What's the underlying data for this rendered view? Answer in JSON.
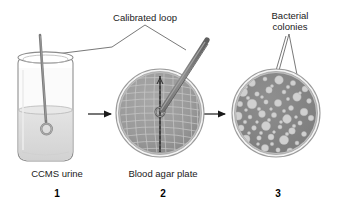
{
  "figure": {
    "type": "diagram",
    "background_color": "#ffffff",
    "ink_color": "#1a1a1a"
  },
  "annotations": {
    "calibrated_loop": {
      "label": "Calibrated loop",
      "x": 103,
      "y": 12,
      "width": 84
    },
    "bacterial_colonies": {
      "label_line1": "Bacterial",
      "label_line2": "colonies",
      "x": 261,
      "y": 10,
      "width": 58
    }
  },
  "steps": [
    {
      "number": "1",
      "caption": "CCMS urine",
      "caption_x": 12,
      "caption_y": 168,
      "caption_width": 90,
      "number_x": 37,
      "number_y": 188,
      "object": "specimen-jar"
    },
    {
      "number": "2",
      "caption": "Blood agar plate",
      "caption_x": 110,
      "caption_y": 168,
      "caption_width": 106,
      "number_x": 143,
      "number_y": 188,
      "object": "streaked-agar-plate"
    },
    {
      "number": "3",
      "caption": "",
      "caption_x": 240,
      "caption_y": 168,
      "caption_width": 60,
      "number_x": 258,
      "number_y": 188,
      "object": "colony-plate"
    }
  ],
  "colors": {
    "jar_glass_stroke": "#8c8c8c",
    "jar_liquid": "#dcdcdc",
    "wire": "#7a7a7a",
    "agar_fill": "#9a9a9a",
    "agar_rim": "#b5b5b5",
    "streak_line": "#c9c9c9",
    "colony_fill": "#cfcfcf",
    "arrow": "#1a1a1a",
    "leader_line": "#555555"
  },
  "arrows": [
    {
      "name": "arrow-jar-to-plate",
      "x1": 88,
      "y1": 114,
      "x2": 114,
      "y2": 114
    },
    {
      "name": "arrow-plate-to-colonies",
      "x1": 202,
      "y1": 114,
      "x2": 228,
      "y2": 114
    }
  ],
  "agar_plate": {
    "center_x": 160,
    "center_y": 113,
    "radius": 44,
    "streak_description": "single vertical inoculation line with perpendicular cross-streaks"
  },
  "colony_plate": {
    "center_x": 276,
    "center_y": 113,
    "radius": 44,
    "colony_count": 62,
    "colony_size_range": "1.5-5 px radius"
  }
}
